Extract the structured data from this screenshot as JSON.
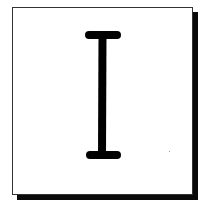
{
  "figure": {
    "icon": "text-cursor-ibeam-icon",
    "colors": {
      "background": "#ffffff",
      "card_border": "#333333",
      "shadow": "#0a0a0a",
      "glyph": "#000000"
    }
  }
}
